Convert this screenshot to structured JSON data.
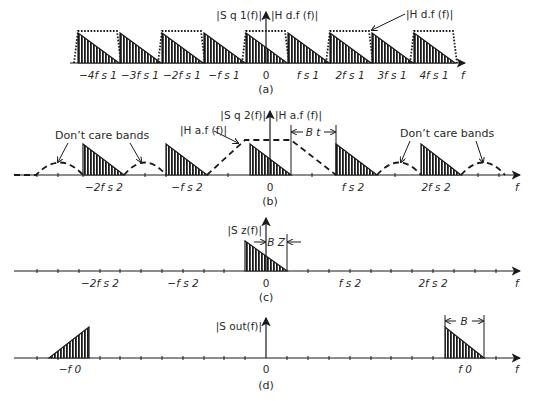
{
  "figure": {
    "panels": [
      {
        "id": "a",
        "caption": "(a)",
        "y_label": "|S q 1(f)|",
        "y_label2": "|H d.f (f)|",
        "filter_callout": "|H d.f (f)|",
        "axis_label": "f",
        "ticks": [
          "−4f s 1",
          "−3f s 1",
          "−2f s 1",
          "−f s 1",
          "0",
          "f s 1",
          "2f s 1",
          "3f s 1",
          "4f s 1"
        ]
      },
      {
        "id": "b",
        "caption": "(b)",
        "y_label": "|S q 2(f)|",
        "y_label2": "|H a.f (f)|",
        "filter_callout": "|H a.f (f)|",
        "dont_care_left": "Don’t care bands",
        "dont_care_right": "Don’t care bands",
        "bandwidth_label": "B t",
        "axis_label": "f",
        "ticks": [
          "−2f s 2",
          "−f s 2",
          "0",
          "f s 2",
          "2f s 2"
        ]
      },
      {
        "id": "c",
        "caption": "(c)",
        "y_label": "|S z(f)|",
        "bandwidth_label": "B Z",
        "axis_label": "f",
        "ticks": [
          "−2f s 2",
          "−f s 2",
          "0",
          "f s 2",
          "2f s 2"
        ]
      },
      {
        "id": "d",
        "caption": "(d)",
        "y_label": "|S out(f)|",
        "bandwidth_label": "B",
        "axis_label": "f",
        "ticks": [
          "−f 0",
          "0",
          "f 0"
        ]
      }
    ]
  },
  "colors": {
    "ink": "#1a1a1a",
    "text": "#2a2a2a",
    "background": "#ffffff"
  }
}
